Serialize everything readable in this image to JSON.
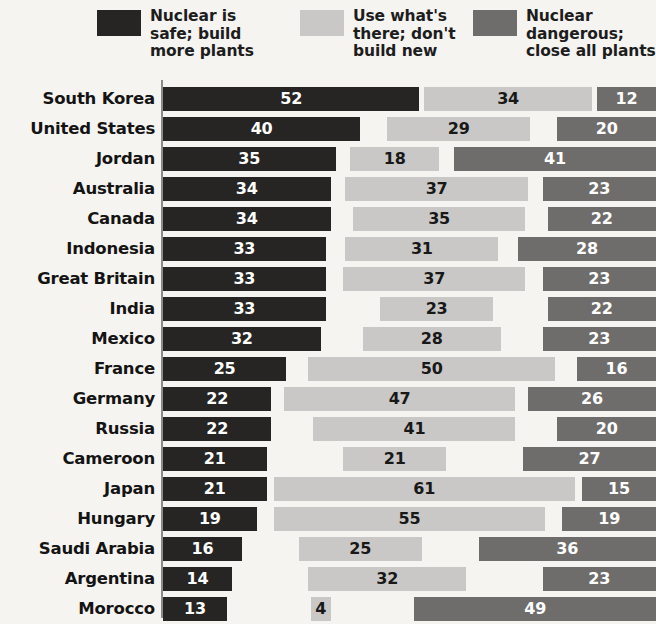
{
  "legend": {
    "items": [
      {
        "label": "Nuclear is\nsafe; build\nmore plants",
        "color": "#262524",
        "key": "safe_build_more"
      },
      {
        "label": "Use what's\nthere; don't\nbuild new",
        "color": "#c9c8c6",
        "key": "use_existing"
      },
      {
        "label": "Nuclear\ndangerous;\nclose all plants",
        "color": "#6e6d6b",
        "key": "dangerous_close"
      }
    ]
  },
  "chart_data": {
    "type": "bar",
    "subtype": "stacked-horizontal",
    "title": "",
    "xlabel": "",
    "ylabel": "",
    "xlim": [
      0,
      100
    ],
    "grid": false,
    "legend_position": "top",
    "value_unit": "percent",
    "categories": [
      "South Korea",
      "United States",
      "Jordan",
      "Australia",
      "Canada",
      "Indonesia",
      "Great Britain",
      "India",
      "Mexico",
      "France",
      "Germany",
      "Russia",
      "Cameroon",
      "Japan",
      "Hungary",
      "Saudi Arabia",
      "Argentina",
      "Morocco"
    ],
    "series": [
      {
        "name": "Nuclear is safe; build more plants",
        "color": "#262524",
        "values": [
          52,
          40,
          35,
          34,
          34,
          33,
          33,
          33,
          32,
          25,
          22,
          22,
          21,
          21,
          19,
          16,
          14,
          13
        ]
      },
      {
        "name": "Use what's there; don't build new",
        "color": "#c9c8c6",
        "values": [
          34,
          29,
          18,
          37,
          35,
          31,
          37,
          23,
          28,
          50,
          47,
          41,
          21,
          61,
          55,
          25,
          32,
          4
        ]
      },
      {
        "name": "Nuclear dangerous; close all plants",
        "color": "#6e6d6b",
        "values": [
          12,
          20,
          41,
          23,
          22,
          28,
          23,
          22,
          23,
          16,
          26,
          20,
          27,
          15,
          19,
          36,
          23,
          49
        ]
      }
    ]
  }
}
